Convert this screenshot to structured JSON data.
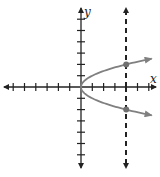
{
  "diagram": {
    "type": "coordinate-plane",
    "axes": {
      "x_label": "x",
      "y_label": "y",
      "x_range": [
        -7,
        6
      ],
      "y_range": [
        -6,
        6
      ],
      "tick_spacing": 1
    },
    "curve": {
      "equation": "x = y^2",
      "color": "#808080",
      "upper_branch_end": [
        6.2,
        2.5
      ],
      "lower_branch_end": [
        6.2,
        -2.5
      ]
    },
    "vertical_line": {
      "x": 4,
      "style": "dashed",
      "color": "#222222"
    },
    "intersection_points": [
      {
        "x": 4,
        "y": 2
      },
      {
        "x": 4,
        "y": -2
      }
    ],
    "colors": {
      "axis": "#222222",
      "curve": "#808080",
      "points": "#707070"
    }
  }
}
